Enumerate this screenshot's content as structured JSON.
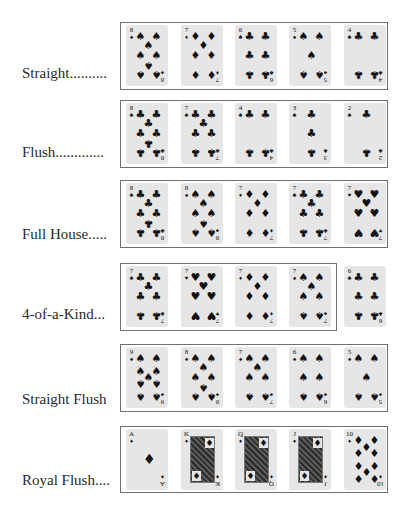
{
  "hands": [
    {
      "id": "straight",
      "label": "Straight..........",
      "box": {
        "top": 22,
        "height": 68,
        "width": 268
      },
      "cards": [
        {
          "rank": "8",
          "suit": "spade",
          "glyph": "♠"
        },
        {
          "rank": "7",
          "suit": "diamond",
          "glyph": "♦"
        },
        {
          "rank": "6",
          "suit": "club",
          "glyph": "♣"
        },
        {
          "rank": "5",
          "suit": "spade",
          "glyph": "♠"
        },
        {
          "rank": "4",
          "suit": "club",
          "glyph": "♣"
        }
      ]
    },
    {
      "id": "flush",
      "label": "Flush.............",
      "box": {
        "top": 100,
        "height": 68,
        "width": 268
      },
      "cards": [
        {
          "rank": "8",
          "suit": "club",
          "glyph": "♣"
        },
        {
          "rank": "7",
          "suit": "club",
          "glyph": "♣"
        },
        {
          "rank": "4",
          "suit": "club",
          "glyph": "♣"
        },
        {
          "rank": "3",
          "suit": "club",
          "glyph": "♣"
        },
        {
          "rank": "2",
          "suit": "club",
          "glyph": "♣"
        }
      ]
    },
    {
      "id": "full-house",
      "label": "Full House.....",
      "box": {
        "top": 180,
        "height": 68,
        "width": 268
      },
      "cards": [
        {
          "rank": "8",
          "suit": "club",
          "glyph": "♣"
        },
        {
          "rank": "8",
          "suit": "spade",
          "glyph": "♠"
        },
        {
          "rank": "7",
          "suit": "diamond",
          "glyph": "♦"
        },
        {
          "rank": "7",
          "suit": "club",
          "glyph": "♣"
        },
        {
          "rank": "7",
          "suit": "heart",
          "glyph": "♥"
        }
      ]
    },
    {
      "id": "four-of-a-kind",
      "label": "4-of-a-Kind...",
      "box": {
        "top": 263,
        "height": 68,
        "width": 217
      },
      "cards": [
        {
          "rank": "7",
          "suit": "club",
          "glyph": "♣"
        },
        {
          "rank": "7",
          "suit": "heart",
          "glyph": "♥"
        },
        {
          "rank": "7",
          "suit": "diamond",
          "glyph": "♦"
        },
        {
          "rank": "7",
          "suit": "spade",
          "glyph": "♠"
        },
        {
          "rank": "6",
          "suit": "club",
          "glyph": "♣"
        }
      ]
    },
    {
      "id": "straight-flush",
      "label": "Straight Flush",
      "box": {
        "top": 344,
        "height": 68,
        "width": 268
      },
      "cards": [
        {
          "rank": "9",
          "suit": "spade",
          "glyph": "♠"
        },
        {
          "rank": "8",
          "suit": "spade",
          "glyph": "♠"
        },
        {
          "rank": "7",
          "suit": "spade",
          "glyph": "♠"
        },
        {
          "rank": "6",
          "suit": "spade",
          "glyph": "♠"
        },
        {
          "rank": "5",
          "suit": "spade",
          "glyph": "♠"
        }
      ]
    },
    {
      "id": "royal-flush",
      "label": "Royal Flush....",
      "box": {
        "top": 426,
        "height": 67,
        "width": 268
      },
      "cards": [
        {
          "rank": "A",
          "suit": "diamond",
          "glyph": "♦"
        },
        {
          "rank": "K",
          "suit": "diamond",
          "glyph": "♦"
        },
        {
          "rank": "Q",
          "suit": "diamond",
          "glyph": "♦"
        },
        {
          "rank": "J",
          "suit": "diamond",
          "glyph": "♦"
        },
        {
          "rank": "10",
          "suit": "diamond",
          "glyph": "♦"
        }
      ]
    }
  ]
}
